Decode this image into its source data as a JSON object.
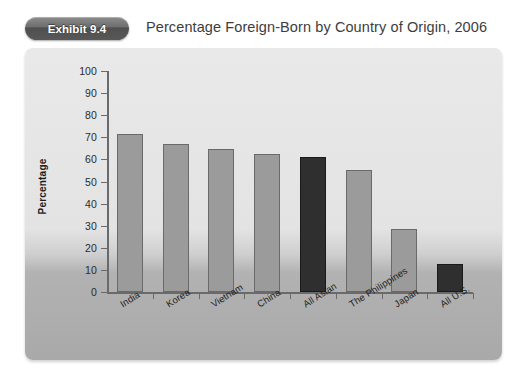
{
  "exhibit": {
    "badge_label": "Exhibit 9.4",
    "title": "Percentage Foreign-Born by Country of Origin, 2006"
  },
  "colors": {
    "bar_light": "#9b9b9b",
    "bar_dark": "#2f2f2f",
    "bar_border": "#6a6a6a",
    "panel_top": "#e9e9e9",
    "panel_bottom": "#a9a9a9",
    "badge": "#585858",
    "title_text": "#3d3d3d",
    "axis": "#6a6a6a"
  },
  "chart_data": {
    "type": "bar",
    "title": "Percentage Foreign-Born by Country of Origin, 2006",
    "xlabel": "",
    "ylabel": "Percentage",
    "ylim": [
      0,
      100
    ],
    "ytick_step": 10,
    "yticks": [
      0,
      10,
      20,
      30,
      40,
      50,
      60,
      70,
      80,
      90,
      100
    ],
    "ytick_labels": [
      "0",
      "10",
      "20",
      "30",
      "40",
      "50",
      "60",
      "70",
      "80",
      "90",
      "100"
    ],
    "grid": false,
    "legend": "none",
    "categories": [
      "India",
      "Korea",
      "Vietnam",
      "China",
      "All Asian",
      "The Philippines",
      "Japan",
      "All U.S."
    ],
    "values": [
      71.5,
      67.0,
      64.5,
      62.5,
      61.0,
      55.0,
      28.5,
      12.5
    ],
    "bar_styles": [
      "light",
      "light",
      "light",
      "light",
      "dark",
      "light",
      "light",
      "dark"
    ],
    "value_unit": "percent"
  }
}
